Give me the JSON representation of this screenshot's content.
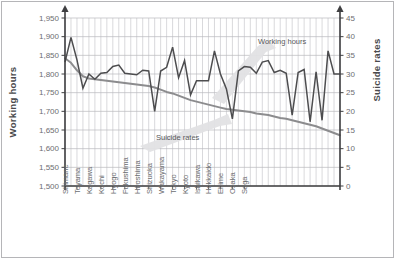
{
  "chart_data": {
    "type": "line",
    "title": "",
    "grid": true,
    "legend_position": "inline-annotations",
    "colors": {
      "working_hours": "#4d4d4f",
      "suicide_rates": "#8c8c8e",
      "axis": "#3f3f41",
      "grid": "#c9c9cd",
      "band": "#e2e2e4",
      "frame": "#b5b5b8"
    },
    "axes": {
      "left": {
        "label": "Working hours",
        "ticks": [
          "1,500",
          "1,550",
          "1,600",
          "1,650",
          "1,700",
          "1,750",
          "1,800",
          "1,850",
          "1,900",
          "1,950"
        ],
        "tick_values": [
          1500,
          1550,
          1600,
          1650,
          1700,
          1750,
          1800,
          1850,
          1900,
          1950
        ],
        "min": 1500,
        "max": 1950
      },
      "right": {
        "label": "Suicide rates",
        "ticks": [
          "0",
          "5",
          "10",
          "15",
          "20",
          "25",
          "30",
          "35",
          "40",
          "45"
        ],
        "tick_values": [
          0,
          5,
          10,
          15,
          20,
          25,
          30,
          35,
          40,
          45
        ],
        "min": 0,
        "max": 45
      },
      "x": {
        "label": ""
      }
    },
    "annotations": [
      {
        "name": "working-hours-annotation",
        "text": "Working hours"
      },
      {
        "name": "suicide-rates-annotation",
        "text": "Suicide rates"
      }
    ],
    "categories": [
      "Shimane",
      "",
      "Toyama",
      "",
      "Kagawa",
      "",
      "Kochi",
      "",
      "Hyogo",
      "",
      "Fukushima",
      "",
      "Hiroshima",
      "",
      "Shizuoka",
      "",
      "Wakayama",
      "",
      "Tokyo",
      "",
      "Kyoto",
      "",
      "Ishikawa",
      "",
      "Hokkaido",
      "",
      "Ehime",
      "",
      "Osaka",
      "",
      "Saga",
      "",
      "",
      "",
      "",
      "",
      "",
      "",
      "",
      "",
      "",
      "",
      "",
      "",
      "",
      "",
      ""
    ],
    "x_tick_labels": [
      "Shimane",
      "Toyama",
      "Kagawa",
      "Kochi",
      "Hyogo",
      "Fukushima",
      "Hiroshima",
      "Shizuoka",
      "Wakayama",
      "Tokyo",
      "Kyoto",
      "Ishikawa",
      "Hokkaido",
      "Ehime",
      "Osaka",
      "Saga"
    ],
    "series": [
      {
        "name": "Working hours",
        "axis": "left",
        "unit": "hours/year",
        "values": [
          1832,
          1898,
          1838,
          1762,
          1800,
          1786,
          1802,
          1804,
          1820,
          1824,
          1802,
          1800,
          1798,
          1810,
          1808,
          1700,
          1808,
          1818,
          1872,
          1790,
          1836,
          1744,
          1782,
          1782,
          1782,
          1862,
          1800,
          1760,
          1680,
          1808,
          1820,
          1818,
          1802,
          1832,
          1836,
          1804,
          1810,
          1802,
          1690,
          1804,
          1812,
          1672,
          1806,
          1676,
          1862,
          1800,
          1800
        ]
      },
      {
        "name": "Suicide rates",
        "axis": "right",
        "unit": "per 100,000",
        "values": [
          34.2,
          33.0,
          31.0,
          29.4,
          28.8,
          28.6,
          28.4,
          28.2,
          28.0,
          27.8,
          27.6,
          27.4,
          27.2,
          27.0,
          26.8,
          26.4,
          25.8,
          25.2,
          24.8,
          24.2,
          23.6,
          23.0,
          22.6,
          22.2,
          21.8,
          21.4,
          21.0,
          20.6,
          20.4,
          20.2,
          20.0,
          19.8,
          19.4,
          19.2,
          19.0,
          18.6,
          18.2,
          18.0,
          17.6,
          17.2,
          16.8,
          16.4,
          16.0,
          15.4,
          14.8,
          14.2,
          13.6
        ]
      }
    ]
  }
}
